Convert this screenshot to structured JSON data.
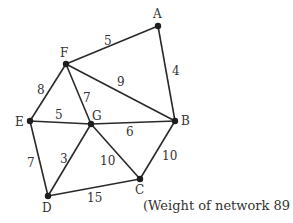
{
  "diagram": {
    "type": "weighted-graph",
    "nodes": [
      {
        "id": "A",
        "x": 158,
        "y": 26,
        "lx": 153,
        "ly": 18
      },
      {
        "id": "F",
        "x": 66,
        "y": 64,
        "lx": 60,
        "ly": 57
      },
      {
        "id": "B",
        "x": 175,
        "y": 121,
        "lx": 181,
        "ly": 125
      },
      {
        "id": "E",
        "x": 30,
        "y": 121,
        "lx": 15,
        "ly": 126
      },
      {
        "id": "G",
        "x": 91,
        "y": 124,
        "lx": 92,
        "ly": 120
      },
      {
        "id": "D",
        "x": 48,
        "y": 196,
        "lx": 42,
        "ly": 212
      },
      {
        "id": "C",
        "x": 140,
        "y": 179,
        "lx": 135,
        "ly": 194
      }
    ],
    "edges": [
      {
        "from": "F",
        "to": "A",
        "weight": "5",
        "lx": 104,
        "ly": 45
      },
      {
        "from": "A",
        "to": "B",
        "weight": "4",
        "lx": 172,
        "ly": 75
      },
      {
        "from": "F",
        "to": "B",
        "weight": "9",
        "lx": 117,
        "ly": 86
      },
      {
        "from": "F",
        "to": "E",
        "weight": "8",
        "lx": 37,
        "ly": 94
      },
      {
        "from": "F",
        "to": "G",
        "weight": "7",
        "lx": 83,
        "ly": 102
      },
      {
        "from": "E",
        "to": "G",
        "weight": "5",
        "lx": 55,
        "ly": 119
      },
      {
        "from": "G",
        "to": "B",
        "weight": "6",
        "lx": 126,
        "ly": 136
      },
      {
        "from": "E",
        "to": "D",
        "weight": "7",
        "lx": 27,
        "ly": 167
      },
      {
        "from": "G",
        "to": "D",
        "weight": "3",
        "lx": 60,
        "ly": 163
      },
      {
        "from": "G",
        "to": "C",
        "weight": "10",
        "lx": 100,
        "ly": 165
      },
      {
        "from": "B",
        "to": "C",
        "weight": "10",
        "lx": 162,
        "ly": 160
      },
      {
        "from": "D",
        "to": "C",
        "weight": "15",
        "lx": 87,
        "ly": 202
      }
    ],
    "caption": "(Weight of network 89 km)"
  }
}
